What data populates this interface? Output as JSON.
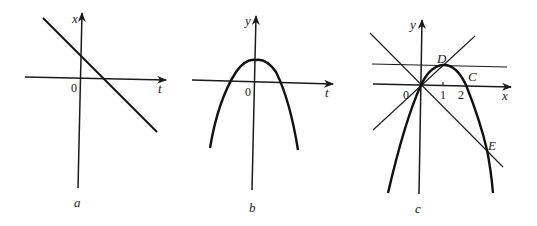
{
  "figures": [
    {
      "id": "a",
      "caption": "a",
      "axes": {
        "horizontal": "t",
        "vertical": "x",
        "origin": "0"
      },
      "curve": "decreasing straight line crossing positive vertical axis and positive t axis"
    },
    {
      "id": "b",
      "caption": "b",
      "axes": {
        "horizontal": "t",
        "vertical": "y",
        "origin": "0"
      },
      "curve": "downward-opening parabola with vertex on positive vertical axis"
    },
    {
      "id": "c",
      "caption": "c",
      "axes": {
        "horizontal": "x",
        "vertical": "y",
        "origin": "0"
      },
      "ticks": [
        "1",
        "2"
      ],
      "points": {
        "D": "D",
        "C": "C",
        "E": "E"
      },
      "curve": "downward parabola through origin, peak D near x=1, crossing x axis at C (x=2), intersected by horizontal tangent at D, line y=x through origin and line through origin with negative slope meeting curve at E"
    }
  ],
  "colors": {
    "ink": "#1a1a1a",
    "background": "#ffffff"
  }
}
